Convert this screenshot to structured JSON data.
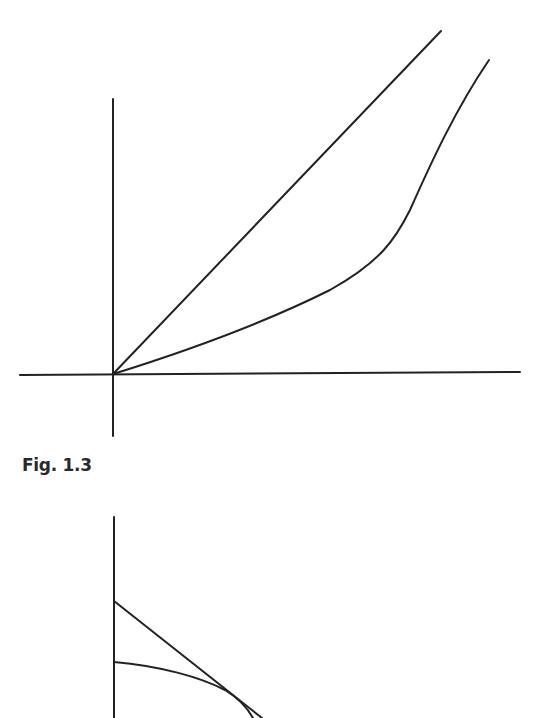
{
  "figures": [
    {
      "id": "top",
      "description": "Axes with a straight line from the origin and a convex curve from the origin",
      "axes": {
        "origin": [
          113,
          374
        ],
        "x_axis": {
          "from": [
            20,
            375
          ],
          "to": [
            520,
            372
          ]
        },
        "y_axis": {
          "from": [
            113,
            99
          ],
          "to": [
            113,
            436
          ]
        }
      },
      "lines": [
        {
          "name": "straight-line",
          "type": "line",
          "points": [
            [
              113,
              374
            ],
            [
              441,
              31
            ]
          ]
        },
        {
          "name": "convex-curve",
          "type": "curve",
          "points": [
            [
              113,
              374
            ],
            [
              200,
              345
            ],
            [
              300,
              302
            ],
            [
              370,
              260
            ],
            [
              400,
              220
            ],
            [
              430,
              160
            ],
            [
              470,
              100
            ],
            [
              489,
              60
            ]
          ]
        }
      ]
    },
    {
      "id": "bottom",
      "description": "Vertical axis with a downward sloping straight line and a concave curve tangent to it",
      "axes": {
        "y_axis": {
          "from": [
            114,
            517
          ],
          "to": [
            114,
            718
          ]
        }
      },
      "lines": [
        {
          "name": "straight-line",
          "type": "line",
          "points": [
            [
              114,
              601
            ],
            [
              262,
              718
            ]
          ]
        },
        {
          "name": "concave-curve",
          "type": "curve",
          "points": [
            [
              114,
              662
            ],
            [
              170,
              672
            ],
            [
              220,
              688
            ],
            [
              240,
              702
            ],
            [
              253,
              718
            ]
          ]
        }
      ]
    }
  ],
  "caption": {
    "text": "Fig. 1.3"
  },
  "style": {
    "stroke": "#222222",
    "stroke_width": 2
  }
}
